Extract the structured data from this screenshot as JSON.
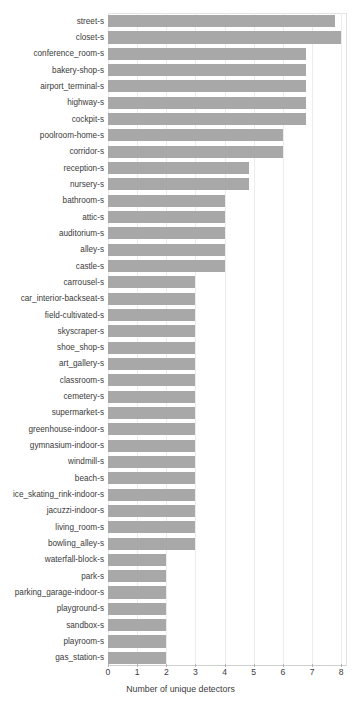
{
  "chart_data": {
    "type": "bar",
    "orientation": "horizontal",
    "title": "",
    "xlabel": "Number of unique detectors",
    "ylabel": "",
    "xlim": [
      0,
      8.2
    ],
    "xticks": [
      0,
      1,
      2,
      3,
      4,
      5,
      6,
      7,
      8
    ],
    "grid": true,
    "legend": null,
    "bar_color": "#a8a8a8",
    "categories": [
      "street-s",
      "closet-s",
      "conference_room-s",
      "bakery-shop-s",
      "airport_terminal-s",
      "highway-s",
      "cockpit-s",
      "poolroom-home-s",
      "corridor-s",
      "reception-s",
      "nursery-s",
      "bathroom-s",
      "attic-s",
      "auditorium-s",
      "alley-s",
      "castle-s",
      "carrousel-s",
      "car_interior-backseat-s",
      "field-cultivated-s",
      "skyscraper-s",
      "shoe_shop-s",
      "art_gallery-s",
      "classroom-s",
      "cemetery-s",
      "supermarket-s",
      "greenhouse-indoor-s",
      "gymnasium-indoor-s",
      "windmill-s",
      "beach-s",
      "ice_skating_rink-indoor-s",
      "jacuzzi-indoor-s",
      "living_room-s",
      "bowling_alley-s",
      "waterfall-block-s",
      "park-s",
      "parking_garage-indoor-s",
      "playground-s",
      "sandbox-s",
      "playroom-s",
      "gas_station-s"
    ],
    "values": [
      7.8,
      8.0,
      6.8,
      6.8,
      6.8,
      6.8,
      6.8,
      6.0,
      6.0,
      4.85,
      4.85,
      4.0,
      4.0,
      4.0,
      4.0,
      4.0,
      3.0,
      3.0,
      3.0,
      3.0,
      3.0,
      3.0,
      3.0,
      3.0,
      3.0,
      3.0,
      3.0,
      3.0,
      3.0,
      3.0,
      3.0,
      3.0,
      3.0,
      2.0,
      2.0,
      2.0,
      2.0,
      2.0,
      2.0,
      2.0
    ]
  }
}
